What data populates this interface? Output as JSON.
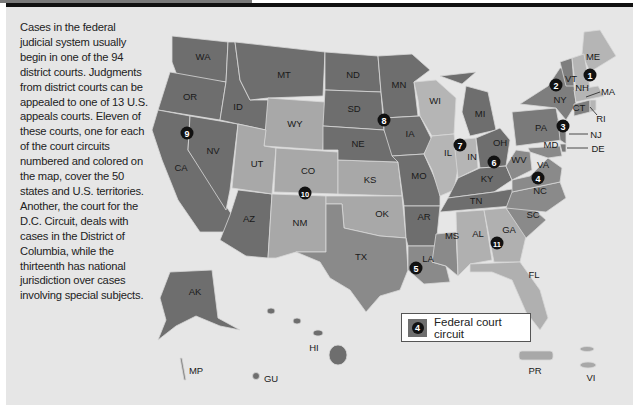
{
  "intro_text": "Cases in the federal judicial system usually begin in one of the 94 district courts. Judgments from district courts can be appealed to one of 13 U.S. appeals courts. Eleven of these courts, one for each of the court circuits numbered and colored on the map, cover the 50 states and U.S. territories. Another, the court for the D.C. Circuit, deals with cases in the District of Columbia, while the thirteenth has national jurisdiction over cases involving special subjects.",
  "legend": {
    "badge": "4",
    "label": "Federal court circuit"
  },
  "colors": {
    "dark": "#6e6e6e",
    "medium": "#8a8a8a",
    "light": "#a8a8a8",
    "lighter": "#bdbdbd",
    "background": "#e6e6e6",
    "badge": "#111111"
  },
  "states": {
    "WA": "WA",
    "OR": "OR",
    "CA": "CA",
    "NV": "NV",
    "ID": "ID",
    "MT": "MT",
    "WY": "WY",
    "UT": "UT",
    "AZ": "AZ",
    "CO": "CO",
    "NM": "NM",
    "ND": "ND",
    "SD": "SD",
    "NE": "NE",
    "KS": "KS",
    "OK": "OK",
    "TX": "TX",
    "MN": "MN",
    "IA": "IA",
    "MO": "MO",
    "AR": "AR",
    "LA": "LA",
    "WI": "WI",
    "IL": "IL",
    "IN": "IN",
    "MI": "MI",
    "OH": "OH",
    "KY": "KY",
    "TN": "TN",
    "MS": "MS",
    "AL": "AL",
    "GA": "GA",
    "FL": "FL",
    "SC": "SC",
    "NC": "NC",
    "VA": "VA",
    "WV": "WV",
    "MD": "MD",
    "DE": "DE",
    "PA": "PA",
    "NJ": "NJ",
    "NY": "NY",
    "CT": "CT",
    "RI": "RI",
    "MA": "MA",
    "VT": "VT",
    "NH": "NH",
    "ME": "ME",
    "AK": "AK",
    "HI": "HI",
    "MP": "MP",
    "GU": "GU",
    "PR": "PR",
    "VI": "VI"
  },
  "circuits": [
    "1",
    "2",
    "3",
    "4",
    "5",
    "6",
    "7",
    "8",
    "9",
    "10",
    "11"
  ]
}
